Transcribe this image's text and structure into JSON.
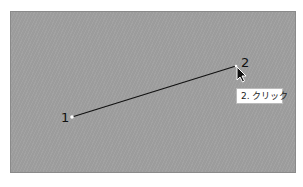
{
  "canvas": {
    "background": "#a0a0a0",
    "line_color": "#111111"
  },
  "points": [
    {
      "label": "1",
      "x": 72,
      "y": 117
    },
    {
      "label": "2",
      "x": 236,
      "y": 66
    }
  ],
  "tooltip": {
    "text": "2. クリック"
  },
  "cursor": {
    "icon": "arrow-pointer-icon"
  }
}
